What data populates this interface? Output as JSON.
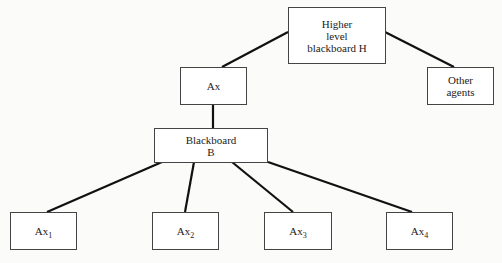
{
  "diagram": {
    "nodes": {
      "higher": {
        "lines": [
          "Higher",
          "level",
          "blackboard H"
        ]
      },
      "ax": {
        "label": "Ax"
      },
      "other": {
        "lines": [
          "Other",
          "agents"
        ]
      },
      "blackboard": {
        "lines": [
          "Blackboard",
          "B"
        ]
      },
      "ax1": {
        "label": "Ax",
        "sub": "1"
      },
      "ax2": {
        "label": "Ax",
        "sub": "2"
      },
      "ax3": {
        "label": "Ax",
        "sub": "3"
      },
      "ax4": {
        "label": "Ax",
        "sub": "4"
      }
    },
    "edges": [
      [
        "higher",
        "ax"
      ],
      [
        "higher",
        "other"
      ],
      [
        "ax",
        "blackboard"
      ],
      [
        "blackboard",
        "ax1"
      ],
      [
        "blackboard",
        "ax2"
      ],
      [
        "blackboard",
        "ax3"
      ],
      [
        "blackboard",
        "ax4"
      ]
    ],
    "colors": {
      "line": "#111111",
      "border": "#444444"
    }
  }
}
